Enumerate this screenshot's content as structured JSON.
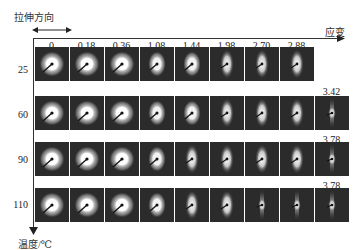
{
  "figure": {
    "stretch_direction_label": "拉伸方向",
    "strain_axis_label": "应变",
    "temperature_axis_label": "温度/℃",
    "strain_columns": [
      "0",
      "0.18",
      "0.36",
      "1.08",
      "1.44",
      "1.98",
      "2.70",
      "2.88"
    ],
    "rows": [
      {
        "temperature": "25",
        "extra_strain": "",
        "count": 8
      },
      {
        "temperature": "60",
        "extra_strain": "3.42",
        "count": 9
      },
      {
        "temperature": "90",
        "extra_strain": "3.78",
        "count": 9
      },
      {
        "temperature": "110",
        "extra_strain": "3.78",
        "count": 9
      }
    ]
  }
}
